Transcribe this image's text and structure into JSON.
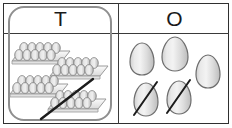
{
  "worksheet": {
    "type": "place-value-chart",
    "columns": [
      {
        "key": "tens",
        "header": "T",
        "header_meaning": "Tens"
      },
      {
        "key": "ones",
        "header": "O",
        "header_meaning": "Ones"
      }
    ]
  },
  "tens_column": {
    "header": "T",
    "item_name": "egg-tray",
    "tray_count": 4,
    "eggs_per_tray": 10,
    "crossed_out_count": 1,
    "trays": [
      {
        "index": 1,
        "crossed_out": false
      },
      {
        "index": 2,
        "crossed_out": false
      },
      {
        "index": 3,
        "crossed_out": false
      },
      {
        "index": 4,
        "crossed_out": true
      }
    ],
    "highlight_box": true
  },
  "ones_column": {
    "header": "O",
    "item_name": "egg",
    "egg_count": 5,
    "crossed_out_count": 2,
    "eggs": [
      {
        "index": 1,
        "crossed_out": false
      },
      {
        "index": 2,
        "crossed_out": false
      },
      {
        "index": 3,
        "crossed_out": false
      },
      {
        "index": 4,
        "crossed_out": true
      },
      {
        "index": 5,
        "crossed_out": true
      }
    ]
  },
  "colors": {
    "border": "#2f2f2f",
    "divider": "#3a3a3a",
    "highlight_box": "#8f8f8f",
    "egg_fill_light": "#efefef",
    "egg_fill_dark": "#b8b8b8",
    "egg_outline": "#6d6d6d",
    "tray_fill": "#f4f4f4",
    "tray_outline": "#9a9a9a",
    "slash": "#1c1c1c",
    "text": "#1a1a1a",
    "page_background": "#ffffff"
  }
}
